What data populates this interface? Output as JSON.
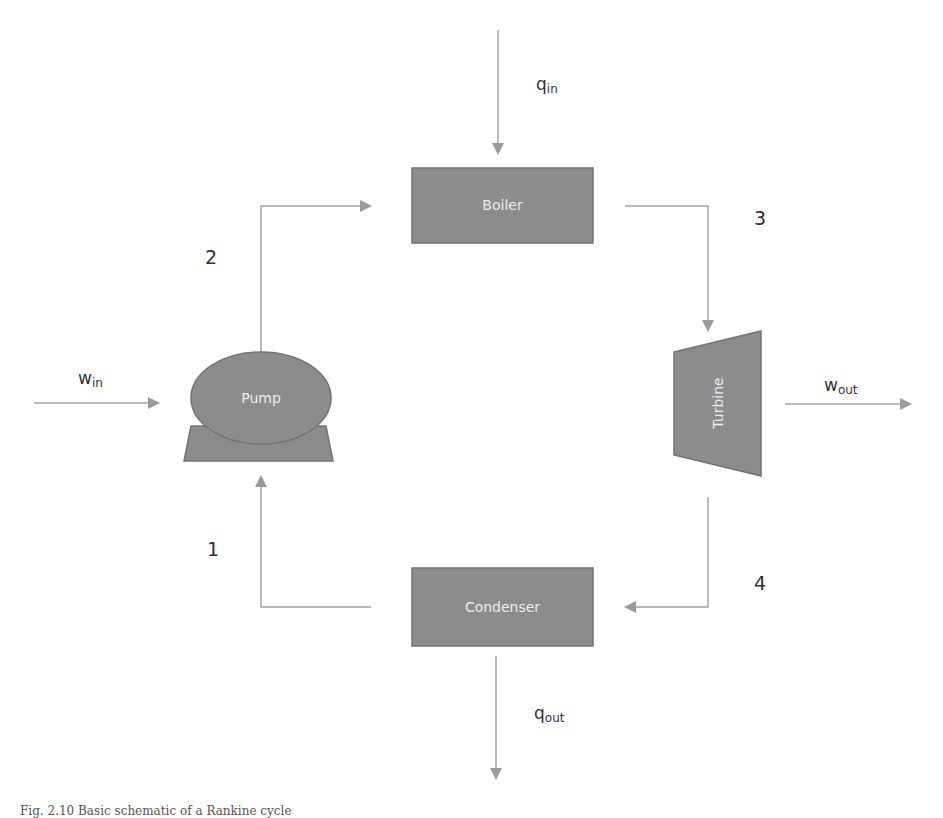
{
  "diagram": {
    "components": {
      "boiler": {
        "label": "Boiler"
      },
      "pump": {
        "label": "Pump"
      },
      "turbine": {
        "label": "Turbine"
      },
      "condenser": {
        "label": "Condenser"
      }
    },
    "energy_flows": {
      "q_in": {
        "symbol": "q",
        "subscript": "in"
      },
      "q_out": {
        "symbol": "q",
        "subscript": "out"
      },
      "w_in": {
        "symbol": "w",
        "subscript": "in"
      },
      "w_out": {
        "symbol": "w",
        "subscript": "out"
      }
    },
    "states": [
      "1",
      "2",
      "3",
      "4"
    ],
    "colors": {
      "component_fill": "#8c8c8c",
      "component_stroke": "#737373",
      "component_text": "#ececec",
      "arrow": "#a3a3a3",
      "label_text": "#333333"
    }
  },
  "caption": "Fig. 2.10 Basic schematic of a Rankine cycle"
}
